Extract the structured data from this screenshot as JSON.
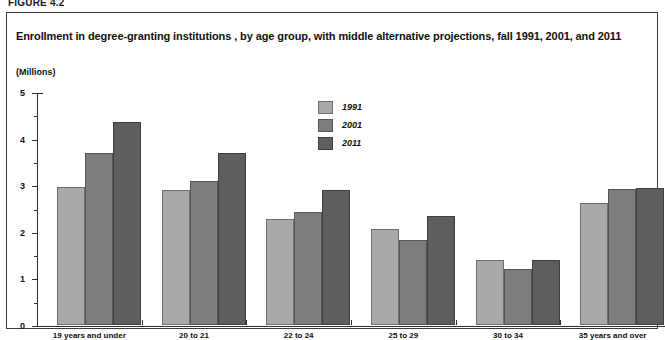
{
  "figure": {
    "label": "FIGURE 4.2"
  },
  "chart_data": {
    "type": "bar",
    "title": "Enrollment in degree-granting institutions , by age group, with middle alternative projections, fall 1991, 2001, and 2011",
    "xlabel": "",
    "ylabel": "(Millions)",
    "ylim": [
      0,
      5
    ],
    "y_ticks": [
      0,
      1,
      2,
      3,
      4,
      5
    ],
    "y_tick_labels": [
      "0",
      "1",
      "2",
      "3",
      "4",
      "5"
    ],
    "y_minor_ticks": [
      0.5,
      1.5,
      2.5,
      3.5,
      4.5
    ],
    "grid": false,
    "legend_position": "upper-center",
    "categories": [
      "19 years and under",
      "20 to 21",
      "22 to 24",
      "25 to 29",
      "30 to 34",
      "35 years and over"
    ],
    "series": [
      {
        "name": "1991",
        "color": "#a9a9a9",
        "values": [
          2.97,
          2.89,
          2.28,
          2.05,
          1.4,
          2.61
        ]
      },
      {
        "name": "2001",
        "color": "#7d7d7d",
        "values": [
          3.7,
          3.09,
          2.43,
          1.83,
          1.21,
          2.92
        ]
      },
      {
        "name": "2011",
        "color": "#5e5e5e",
        "values": [
          4.36,
          3.7,
          2.9,
          2.34,
          1.39,
          2.93
        ]
      }
    ]
  }
}
